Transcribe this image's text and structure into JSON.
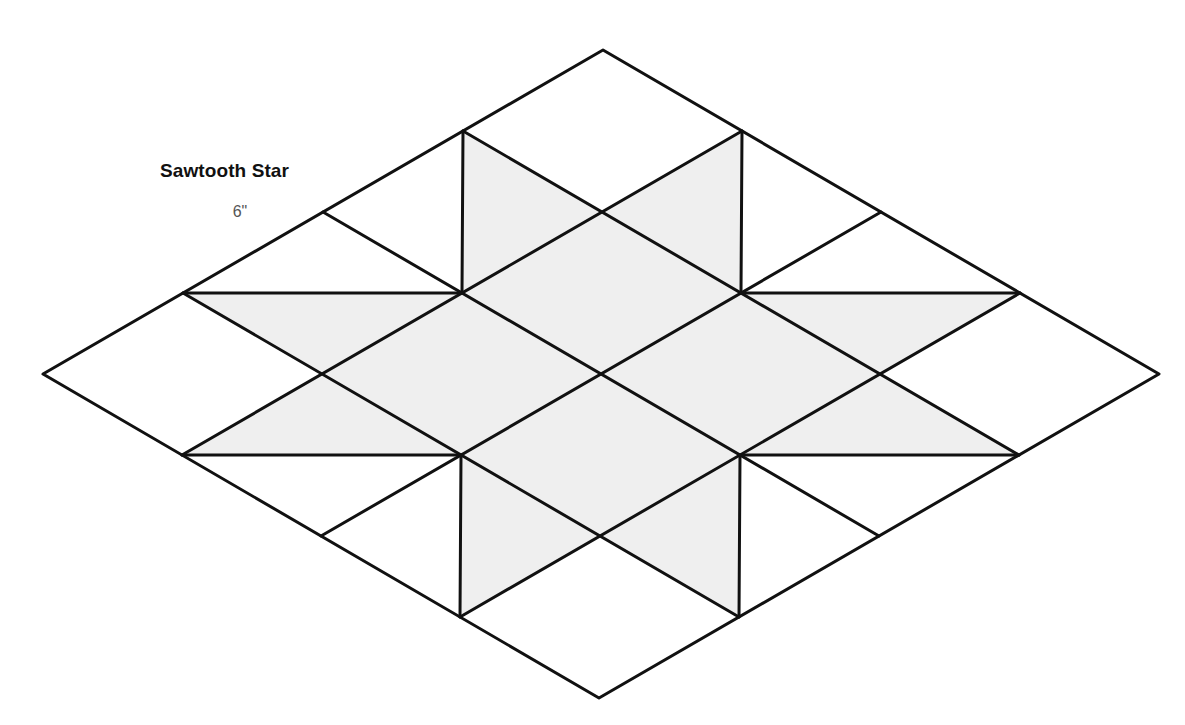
{
  "block": {
    "title": "Sawtooth Star",
    "size_label": "6\""
  },
  "colors": {
    "background": "#ffffff",
    "shaded_fill": "#efefef",
    "outline": "#111111",
    "title_text": "#111111",
    "size_text": "#555555"
  },
  "diagram": {
    "type": "quilt-block-isometric",
    "grid": "4x4 rhombus grid",
    "shaded_regions": [
      "center 2x2 rhombus",
      "8 half-rhombus star points"
    ],
    "white_regions": [
      "4 corner rhombi",
      "8 outer half-rhombus triangles"
    ]
  }
}
